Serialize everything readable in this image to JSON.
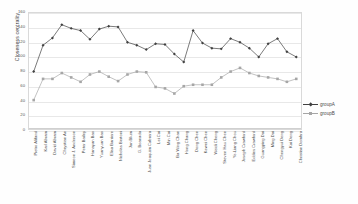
{
  "chart_data": {
    "type": "line",
    "title": "",
    "xlabel": "",
    "ylabel": "Closeness centrality",
    "ylim": [
      0,
      160
    ],
    "ytick_values": [
      0,
      20,
      40,
      60,
      80,
      100,
      120,
      140,
      160
    ],
    "ytick_labels": [
      "0",
      "20",
      "40",
      "60",
      "80",
      "100",
      "120",
      "140",
      "160"
    ],
    "grid": true,
    "legend_position": "right",
    "categories": [
      "Pietro Alifand",
      "Karl Abram",
      "David Abram",
      "Chrystian An",
      "Simeon J. Anderson",
      "Peter Bailey",
      "Hanayan Bao",
      "Yuanyuan Bao",
      "Elisa Barriere",
      "Nicholas Bertoni",
      "Jan Blum",
      "G. Boanada",
      "Juan Joaquim Cabrera",
      "Lei Cai",
      "Min Cai",
      "Ba Wing Chan",
      "Hong Chang",
      "Dong Chen",
      "Kewei Chen",
      "Weidi Cheng",
      "Steven Hau Chen",
      "Ye-Liang Chou",
      "Joseph Crawford",
      "Eddies Crawford",
      "Guangping Dai",
      "Ming Dai",
      "Chengyui Deng",
      "Kai Deng",
      "Christian Dombra"
    ],
    "series": [
      {
        "name": "groupA",
        "color": "#404040",
        "marker": "diamond",
        "values": [
          80,
          116,
          126,
          144,
          139,
          136,
          124,
          138,
          142,
          141,
          120,
          116,
          110,
          118,
          117,
          104,
          93,
          136,
          119,
          112,
          111,
          125,
          120,
          112,
          100,
          118,
          125,
          107,
          100
        ]
      },
      {
        "name": "groupB",
        "color": "#a6a6a6",
        "marker": "square",
        "values": [
          41,
          70,
          70,
          78,
          72,
          66,
          76,
          80,
          73,
          67,
          76,
          80,
          79,
          59,
          57,
          50,
          60,
          62,
          62,
          62,
          72,
          80,
          85,
          78,
          74,
          72,
          70,
          66,
          70
        ]
      }
    ]
  },
  "legend": {
    "entries": [
      {
        "label": "groupA"
      },
      {
        "label": "groupB"
      }
    ]
  }
}
